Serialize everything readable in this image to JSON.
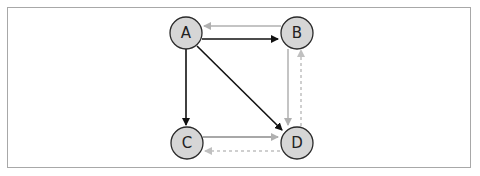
{
  "diagram": {
    "type": "directed-graph",
    "nodes": [
      {
        "id": "A",
        "label": "A",
        "x": 186,
        "y": 33
      },
      {
        "id": "B",
        "label": "B",
        "x": 297,
        "y": 33
      },
      {
        "id": "C",
        "label": "C",
        "x": 187,
        "y": 143
      },
      {
        "id": "D",
        "label": "D",
        "x": 297,
        "y": 143
      }
    ],
    "edges": [
      {
        "from": "A",
        "to": "B",
        "style": "solid",
        "color": "#111111"
      },
      {
        "from": "A",
        "to": "C",
        "style": "solid",
        "color": "#111111"
      },
      {
        "from": "A",
        "to": "D",
        "style": "solid",
        "color": "#111111"
      },
      {
        "from": "B",
        "to": "A",
        "style": "solid",
        "color": "#b0b0b0"
      },
      {
        "from": "B",
        "to": "D",
        "style": "solid",
        "color": "#b0b0b0"
      },
      {
        "from": "C",
        "to": "D",
        "style": "solid",
        "color": "#a8a8a8"
      },
      {
        "from": "D",
        "to": "B",
        "style": "dashed",
        "color": "#b8b8b8"
      },
      {
        "from": "D",
        "to": "C",
        "style": "dashed",
        "color": "#b8b8b8"
      }
    ],
    "colors": {
      "node_fill": "#d6d6d6",
      "node_stroke": "#2a2a2a",
      "frame_border": "#a8a8a8"
    }
  }
}
